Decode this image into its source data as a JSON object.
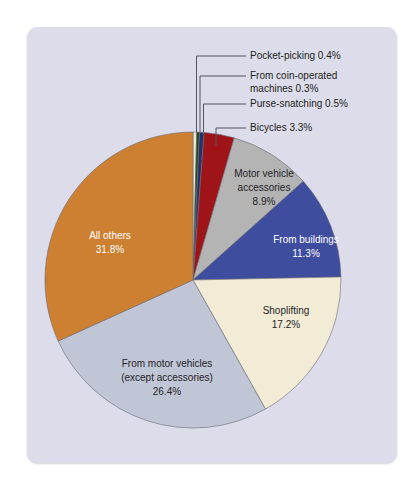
{
  "figure": {
    "name": "property-crime-pie-chart",
    "panel_color": "#dcdcea",
    "background_color": "#ffffff"
  },
  "chart_data": {
    "type": "pie",
    "title": "",
    "subtitle": "",
    "xlabel": "",
    "ylabel": "",
    "legend_position": "none",
    "grid": false,
    "start_angle_deg": 0,
    "direction": "clockwise",
    "center": [
      193,
      280
    ],
    "radius": 148,
    "categories": [
      "Pocket-picking",
      "From coin-operated machines",
      "Purse-snatching",
      "Bicycles",
      "Motor vehicle accessories",
      "From buildings",
      "Shoplifting",
      "From motor vehicles (except accessories)",
      "All others"
    ],
    "values": [
      0.4,
      0.3,
      0.5,
      3.3,
      8.9,
      11.3,
      17.2,
      26.4,
      31.8
    ],
    "colors": [
      "#efe9d2",
      "#1d4a1f",
      "#26306b",
      "#9e1418",
      "#b4b4b4",
      "#3f4d9e",
      "#f2ecd6",
      "#c0c6d6",
      "#cd7f32"
    ],
    "slices": [
      {
        "name": "pocket-picking",
        "label": "Pocket-picking",
        "value": 0.4,
        "value_text": "0.4%",
        "color": "#efe9d2",
        "label_placement": "callout"
      },
      {
        "name": "coin-operated-machines",
        "label": "From coin-operated machines",
        "value": 0.3,
        "value_text": "0.3%",
        "color": "#1d4a1f",
        "label_placement": "callout"
      },
      {
        "name": "purse-snatching",
        "label": "Purse-snatching",
        "value": 0.5,
        "value_text": "0.5%",
        "color": "#26306b",
        "label_placement": "callout"
      },
      {
        "name": "bicycles",
        "label": "Bicycles",
        "value": 3.3,
        "value_text": "3.3%",
        "color": "#9e1418",
        "label_placement": "callout"
      },
      {
        "name": "motor-vehicle-accessories",
        "label": "Motor vehicle accessories",
        "value": 8.9,
        "value_text": "8.9%",
        "color": "#b4b4b4",
        "label_placement": "inside"
      },
      {
        "name": "from-buildings",
        "label": "From buildings",
        "value": 11.3,
        "value_text": "11.3%",
        "color": "#3f4d9e",
        "label_placement": "inside"
      },
      {
        "name": "shoplifting",
        "label": "Shoplifting",
        "value": 17.2,
        "value_text": "17.2%",
        "color": "#f2ecd6",
        "label_placement": "inside"
      },
      {
        "name": "from-motor-vehicles",
        "label": "From motor vehicles (except accessories)",
        "value": 26.4,
        "value_text": "26.4%",
        "color": "#c0c6d6",
        "label_placement": "inside"
      },
      {
        "name": "all-others",
        "label": "All others",
        "value": 31.8,
        "value_text": "31.8%",
        "color": "#cd7f32",
        "label_placement": "inside"
      }
    ]
  },
  "callouts": [
    {
      "name": "callout-pocket-picking",
      "text": "Pocket-picking 0.4%"
    },
    {
      "name": "callout-coin-operated-line1",
      "text": "From coin-operated"
    },
    {
      "name": "callout-coin-operated-line2",
      "text": "machines 0.3%"
    },
    {
      "name": "callout-purse-snatching",
      "text": "Purse-snatching 0.5%"
    },
    {
      "name": "callout-bicycles",
      "text": "Bicycles 3.3%"
    }
  ],
  "inside_labels": {
    "motor_vehicle_accessories": {
      "line1": "Motor vehicle",
      "line2": "accessories",
      "line3": "8.9%"
    },
    "from_buildings": {
      "line1": "From buildings",
      "line2": "11.3%"
    },
    "shoplifting": {
      "line1": "Shoplifting",
      "line2": "17.2%"
    },
    "from_motor_vehicles": {
      "line1": "From motor vehicles",
      "line2": "(except accessories)",
      "line3": "26.4%"
    },
    "all_others": {
      "line1": "All others",
      "line2": "31.8%"
    }
  }
}
